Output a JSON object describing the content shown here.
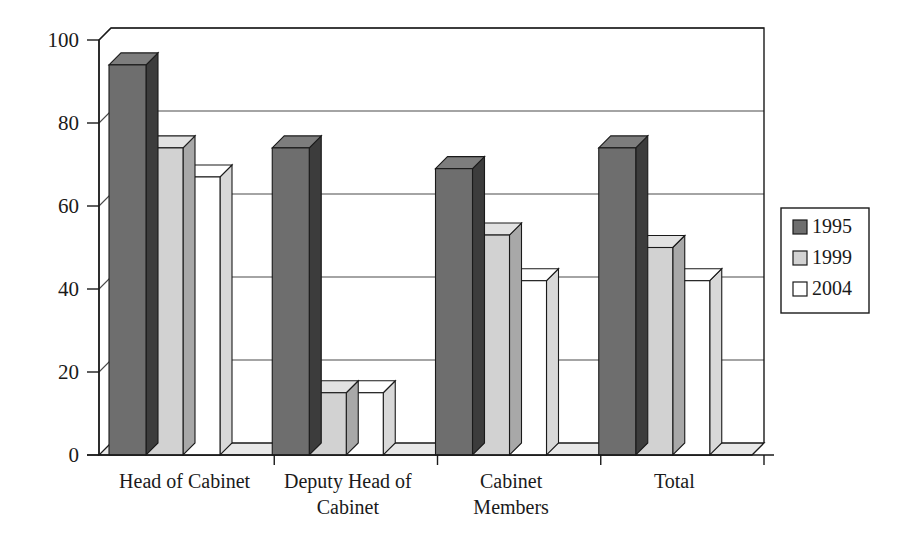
{
  "chart_data": {
    "type": "bar",
    "title": "",
    "subtitle": "",
    "xlabel": "",
    "ylabel": "",
    "ylim": [
      0,
      100
    ],
    "yticks": [
      0,
      20,
      40,
      60,
      80,
      100
    ],
    "ytick_labels": [
      "0",
      "20",
      "40",
      "60",
      "80",
      "100"
    ],
    "grid": true,
    "three_d": true,
    "legend_position": "right",
    "categories": [
      "Head of Cabinet",
      "Deputy Head of Cabinet",
      "Cabinet Members",
      "Total"
    ],
    "category_lines": [
      [
        "Head of Cabinet"
      ],
      [
        "Deputy Head of",
        "Cabinet"
      ],
      [
        "Cabinet",
        "Members"
      ],
      [
        "Total"
      ]
    ],
    "series": [
      {
        "name": "1995",
        "color": "#6e6e6e",
        "top_color": "#7d7d7d",
        "side_color": "#3c3c3c",
        "values": [
          94,
          74,
          69,
          74
        ]
      },
      {
        "name": "1999",
        "color": "#d2d2d2",
        "top_color": "#e2e2e2",
        "side_color": "#a8a8a8",
        "values": [
          74,
          15,
          53,
          50
        ]
      },
      {
        "name": "2004",
        "color": "#ffffff",
        "top_color": "#ffffff",
        "side_color": "#d8d8d8",
        "values": [
          67,
          15,
          42,
          42
        ]
      }
    ]
  },
  "legend": {
    "entries": [
      {
        "label": "1995"
      },
      {
        "label": "1999"
      },
      {
        "label": "2004"
      }
    ]
  },
  "colors": {
    "axis": "#1a1a1a",
    "grid": "#4a4a4a",
    "background": "#ffffff",
    "series_1995": "#6e6e6e",
    "series_1999": "#d2d2d2",
    "series_2004": "#ffffff"
  }
}
